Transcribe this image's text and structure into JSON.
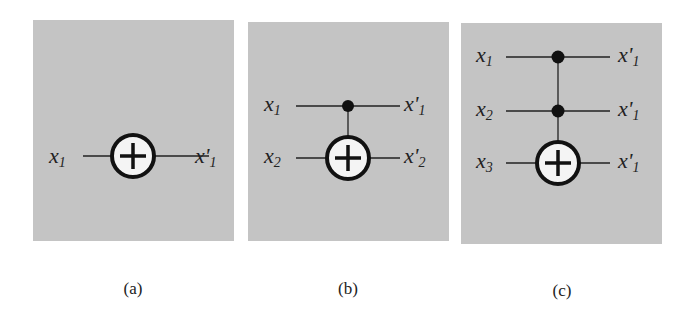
{
  "figure": {
    "background": "#c4c4c4",
    "panels": [
      {
        "id": "a",
        "caption": "(a)",
        "gate": "NOT",
        "inputs": [
          "x",
          "x"
        ],
        "lines": [
          {
            "input_base": "x",
            "input_sub": "1",
            "output_base": "x'",
            "output_sub": "1"
          }
        ]
      },
      {
        "id": "b",
        "caption": "(b)",
        "gate": "CNOT",
        "lines": [
          {
            "input_base": "x",
            "input_sub": "1",
            "output_base": "x'",
            "output_sub": "1"
          },
          {
            "input_base": "x",
            "input_sub": "2",
            "output_base": "x'",
            "output_sub": "2"
          }
        ]
      },
      {
        "id": "c",
        "caption": "(c)",
        "gate": "Toffoli",
        "lines": [
          {
            "input_base": "x",
            "input_sub": "1",
            "output_base": "x'",
            "output_sub": "1"
          },
          {
            "input_base": "x",
            "input_sub": "2",
            "output_base": "x'",
            "output_sub": "1"
          },
          {
            "input_base": "x",
            "input_sub": "3",
            "output_base": "x'",
            "output_sub": "1"
          }
        ]
      }
    ]
  }
}
